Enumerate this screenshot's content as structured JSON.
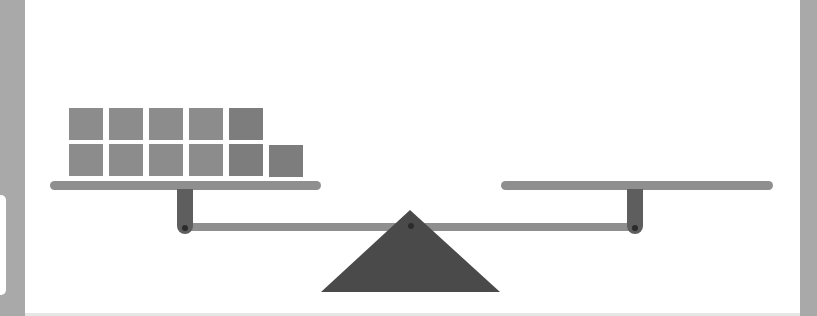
{
  "scene": {
    "title": "",
    "description": "Balance scale (seesaw) with 11 blocks on the left tray and an empty right tray; beam level",
    "left_tray": {
      "block_count": 11,
      "rows": [
        {
          "row": "bottom",
          "count": 6
        },
        {
          "row": "top",
          "count": 5
        }
      ]
    },
    "right_tray": {
      "block_count": 0
    },
    "balance_state": "level"
  },
  "colors": {
    "background": "#ffffff",
    "side_strips": "#a9a9a9",
    "blocks": "#8c8c8c",
    "trays_and_beam": "#8f8f8f",
    "posts": "#5e5e5e",
    "fulcrum": "#4a4a4a",
    "pins": "#2b2b2b"
  }
}
